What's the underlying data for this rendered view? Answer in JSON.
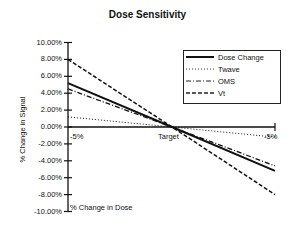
{
  "chart_data": {
    "type": "line",
    "title": "Dose Sensitivity",
    "xlabel": "% Change in Dose",
    "ylabel": "% Change in Signal",
    "categories": [
      "-5%",
      "Target",
      "-5%"
    ],
    "ylim": [
      -10,
      10
    ],
    "yticks": [
      "10.00%",
      "8.00%",
      "6.00%",
      "4.00%",
      "2.00%",
      "0.00%",
      "-2.00%",
      "-4.00%",
      "-6.00%",
      "-8.00%",
      "-10.00%"
    ],
    "grid": false,
    "legend_position": "upper right",
    "series": [
      {
        "name": "Dose Change",
        "style": "solid",
        "values": [
          5.2,
          0,
          -5.2
        ]
      },
      {
        "name": "Twave",
        "style": "dotted",
        "values": [
          1.2,
          0,
          -1.2
        ]
      },
      {
        "name": "OMS",
        "style": "dash-dot",
        "values": [
          4.5,
          0,
          -4.6
        ]
      },
      {
        "name": "Vt",
        "style": "dashed",
        "values": [
          8.0,
          0,
          -8.0
        ]
      }
    ]
  },
  "labels": {
    "title": "Dose Sensitivity",
    "xlabel": "% Change in Dose",
    "ylabel": "% Change in Signal",
    "x_left": "-5%",
    "x_center": "Target",
    "x_right": "-5%"
  },
  "legend": [
    "Dose Change",
    "Twave",
    "OMS",
    "Vt"
  ]
}
